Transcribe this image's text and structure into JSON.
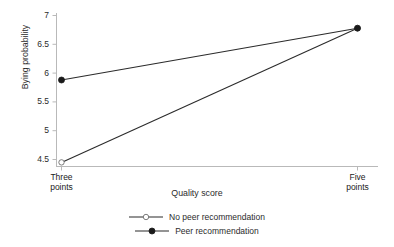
{
  "chart_data": {
    "type": "line",
    "title": "",
    "xlabel": "Quality score",
    "ylabel": "Bying probability",
    "categories": [
      "Three points",
      "Five points"
    ],
    "category_labels_wrapped": [
      [
        "Three",
        "points"
      ],
      [
        "Five",
        "points"
      ]
    ],
    "ylim": [
      4.3,
      7.05
    ],
    "yticks": [
      4.5,
      5,
      5.5,
      6,
      6.5,
      7
    ],
    "ytick_labels": [
      "4.5",
      "5",
      "5.5",
      "6",
      "6.5",
      "7"
    ],
    "grid": false,
    "legend_position": "bottom-center",
    "series": [
      {
        "name": "No peer recommendation",
        "marker": "open-circle",
        "color": "#2b2b2b",
        "values": [
          4.45,
          6.78
        ]
      },
      {
        "name": "Peer recommendation",
        "marker": "filled-circle",
        "color": "#1a1a1a",
        "values": [
          5.88,
          6.78
        ]
      }
    ]
  },
  "legend": {
    "items": [
      {
        "label": "No peer recommendation",
        "marker": "open-circle"
      },
      {
        "label": "Peer recommendation",
        "marker": "filled-circle"
      }
    ]
  },
  "axes": {
    "y_title": "Bying probability",
    "x_title": "Quality score",
    "y_tick_labels": [
      "7",
      "6.5",
      "6",
      "5.5",
      "5",
      "4.5"
    ],
    "x_tick_label_1_line1": "Three",
    "x_tick_label_1_line2": "points",
    "x_tick_label_2_line1": "Five",
    "x_tick_label_2_line2": "points"
  },
  "colors": {
    "axis": "#b9b9b9",
    "line": "#2b2b2b",
    "marker_fill": "#1a1a1a",
    "marker_open_fill": "#ffffff",
    "text": "#2b2b2b",
    "background": "#ffffff"
  }
}
